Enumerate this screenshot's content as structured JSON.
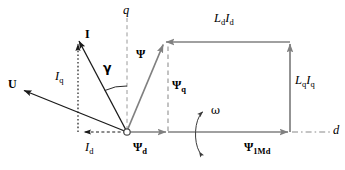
{
  "figure": {
    "type": "phasor-diagram",
    "colors": {
      "black": "#1a1a1a",
      "gray": "#808080",
      "axis_dash": "#9a9a9a",
      "background": "#ffffff"
    }
  },
  "axes": {
    "q_axis": {
      "label": "q",
      "style": "dashed",
      "x": 127,
      "y_top": 18,
      "y_bottom": 132
    },
    "d_axis": {
      "label": "d",
      "style": "dash-dot",
      "y": 132,
      "x_start": 290,
      "x_end": 331
    }
  },
  "origin": {
    "x": 127,
    "y": 132,
    "marker": "open-circle"
  },
  "vectors": [
    {
      "name": "U",
      "label": "U",
      "color": "black",
      "style": "solid",
      "from": [
        127,
        132
      ],
      "to": [
        22,
        90
      ],
      "label_pos": [
        8,
        78
      ]
    },
    {
      "name": "I",
      "label": "I",
      "color": "black",
      "style": "solid",
      "from": [
        127,
        132
      ],
      "to": [
        78,
        38
      ],
      "label_pos": [
        84,
        30
      ]
    },
    {
      "name": "Iq",
      "label": "I_q",
      "label_base": "I",
      "label_sub": "q",
      "color": "black",
      "style": "dotted",
      "from": [
        78,
        132
      ],
      "to": [
        78,
        38
      ],
      "label_pos": [
        55,
        72
      ]
    },
    {
      "name": "Id",
      "label": "I_d",
      "label_base": "I",
      "label_sub": "d",
      "color": "black",
      "style": "dashed",
      "from": [
        127,
        132
      ],
      "to": [
        78,
        132
      ],
      "label_pos": [
        84,
        142
      ]
    },
    {
      "name": "Psi",
      "label": "Ψ",
      "color": "gray",
      "style": "solid",
      "from": [
        127,
        132
      ],
      "to": [
        164,
        42
      ],
      "label_pos": [
        135,
        50
      ]
    },
    {
      "name": "Psi_q",
      "label": "Ψ_q",
      "label_base": "Ψ",
      "label_sub": "q",
      "color": "gray",
      "style": "dashed",
      "from": [
        168,
        132
      ],
      "to": [
        168,
        42
      ],
      "label_pos": [
        172,
        82
      ]
    },
    {
      "name": "Psi_d",
      "label": "Ψ_d",
      "label_base": "Ψ",
      "label_sub": "d",
      "color": "gray",
      "style": "solid",
      "from": [
        127,
        132
      ],
      "to": [
        168,
        132
      ],
      "label_pos": [
        133,
        143
      ]
    },
    {
      "name": "Ld_Id",
      "label": "L_d I_d",
      "label_base_1": "L",
      "label_sub_1": "d",
      "label_base_2": "I",
      "label_sub_2": "d",
      "color": "gray",
      "style": "solid",
      "from": [
        290,
        42
      ],
      "to": [
        164,
        42
      ],
      "label_pos": [
        215,
        14
      ]
    },
    {
      "name": "Lq_Iq",
      "label": "L_q I_q",
      "label_base_1": "L",
      "label_sub_1": "q",
      "label_base_2": "I",
      "label_sub_2": "q",
      "color": "gray",
      "style": "solid",
      "from": [
        290,
        132
      ],
      "to": [
        290,
        42
      ],
      "label_pos": [
        295,
        75
      ]
    },
    {
      "name": "Psi_1Md",
      "label": "Ψ_1Md",
      "label_base": "Ψ",
      "label_sub": "1Md",
      "color": "gray",
      "style": "solid",
      "from": [
        168,
        132
      ],
      "to": [
        290,
        132
      ],
      "label_pos": [
        245,
        143
      ]
    }
  ],
  "angles": [
    {
      "name": "gamma",
      "label": "γ",
      "between": [
        "I",
        "q_axis"
      ],
      "label_pos": [
        102,
        65
      ],
      "arc_radius": 45
    }
  ],
  "annotations": [
    {
      "name": "omega",
      "label": "ω",
      "description": "rotation direction arc",
      "label_pos": [
        212,
        107
      ],
      "arc_center": [
        196,
        133
      ]
    }
  ],
  "labels": {
    "U": "U",
    "I": "I",
    "I_base": "I",
    "q_sub": "q",
    "d_sub": "d",
    "Psi": "Ψ",
    "L_base": "L",
    "one_Md_sub": "1Md",
    "gamma": "γ",
    "omega": "ω",
    "q_axis": "q",
    "d_axis": "d"
  }
}
